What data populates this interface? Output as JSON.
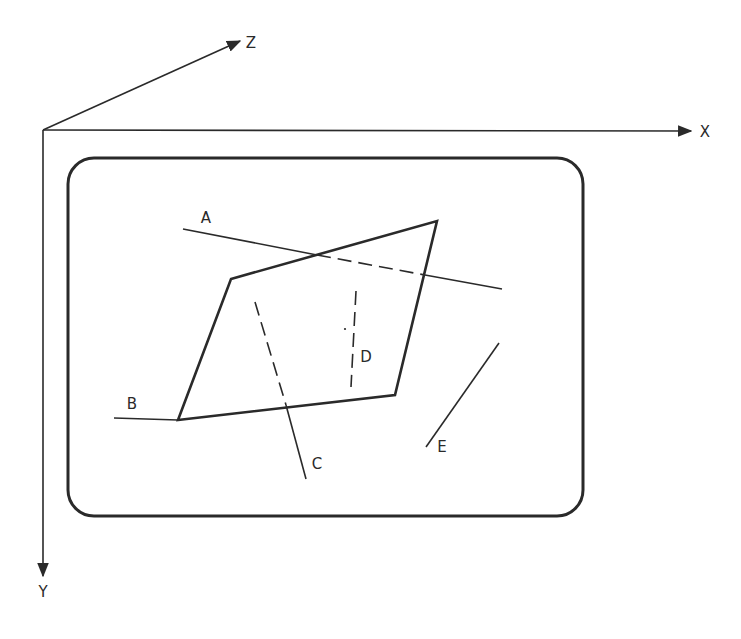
{
  "diagram": {
    "colors": {
      "ink": "#2a2a2a",
      "background": "#ffffff"
    },
    "axes": {
      "origin": [
        43,
        130
      ],
      "x": {
        "label": "X",
        "tip": [
          691,
          131
        ],
        "label_pos": [
          705,
          137
        ]
      },
      "y": {
        "label": "Y",
        "tip": [
          43,
          576
        ],
        "label_pos": [
          43,
          597
        ]
      },
      "z": {
        "label": "Z",
        "tip": [
          240,
          41
        ],
        "label_pos": [
          251,
          48
        ]
      }
    },
    "screen": {
      "x": 68,
      "y": 158,
      "width": 515,
      "height": 358,
      "radius": 26
    },
    "polygon": {
      "points": [
        [
          231,
          279
        ],
        [
          437,
          221
        ],
        [
          395,
          395
        ],
        [
          178,
          420
        ]
      ]
    },
    "lines": [
      {
        "id": "A",
        "label": "A",
        "label_pos": [
          206,
          223
        ],
        "segments": [
          {
            "style": "solid",
            "from": [
              183,
              229
            ],
            "to": [
              317,
              255
            ]
          },
          {
            "style": "dashed",
            "from": [
              317,
              255
            ],
            "to": [
              425,
              275
            ]
          },
          {
            "style": "solid",
            "from": [
              425,
              275
            ],
            "to": [
              502,
              289
            ]
          }
        ]
      },
      {
        "id": "B",
        "label": "B",
        "label_pos": [
          132,
          409
        ],
        "segments": [
          {
            "style": "solid",
            "from": [
              114,
              418
            ],
            "to": [
              178,
              420
            ]
          }
        ]
      },
      {
        "id": "C",
        "label": "C",
        "label_pos": [
          317,
          469
        ],
        "segments": [
          {
            "style": "dashed",
            "from": [
              255,
              302
            ],
            "to": [
              286,
              405
            ]
          },
          {
            "style": "solid",
            "from": [
              286,
              405
            ],
            "to": [
              306,
              479
            ]
          }
        ]
      },
      {
        "id": "D",
        "label": "D",
        "label_pos": [
          366,
          362
        ],
        "segments": [
          {
            "style": "dashed",
            "from": [
              356,
              291
            ],
            "to": [
              351,
              387
            ]
          }
        ]
      },
      {
        "id": "E",
        "label": "E",
        "label_pos": [
          442,
          452
        ],
        "segments": [
          {
            "style": "solid",
            "from": [
              499,
              343
            ],
            "to": [
              426,
              447
            ]
          }
        ]
      }
    ],
    "marks": [
      {
        "type": "dot",
        "pos": [
          345,
          329
        ]
      }
    ]
  }
}
